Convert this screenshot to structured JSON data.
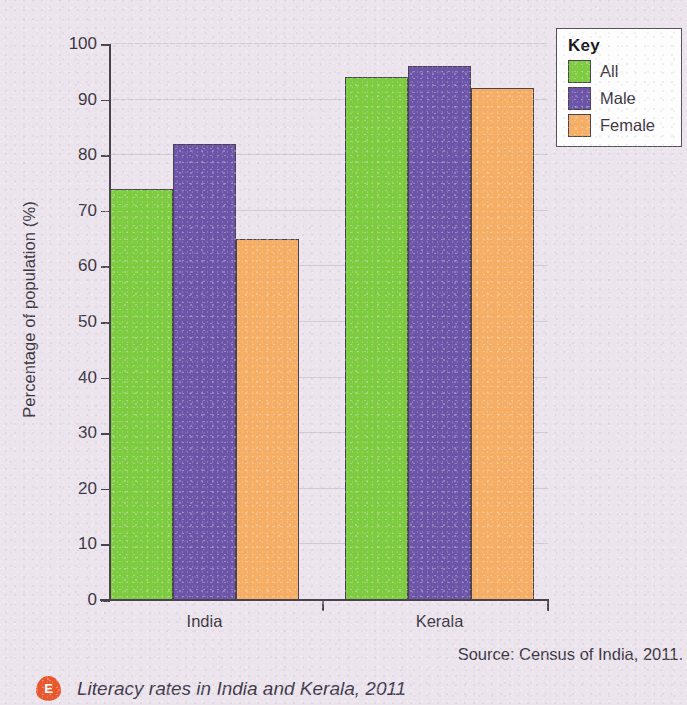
{
  "chart_data": {
    "type": "bar",
    "title": "Literacy rates in India and Kerala, 2011",
    "categories": [
      "India",
      "Kerala"
    ],
    "series": [
      {
        "name": "All",
        "values": [
          74,
          94
        ],
        "color": "#7DCB3F"
      },
      {
        "name": "Male",
        "values": [
          82,
          96
        ],
        "color": "#6C55A8"
      },
      {
        "name": "Female",
        "values": [
          65,
          92
        ],
        "color": "#F5AE63"
      }
    ],
    "xlabel": "",
    "ylabel": "Percentage of population (%)",
    "ylim": [
      0,
      100
    ],
    "ytick_step": 10,
    "yticks": [
      0,
      10,
      20,
      30,
      40,
      50,
      60,
      70,
      80,
      90,
      100
    ],
    "grid": true,
    "legend_position": "top-right",
    "legend_title": "Key",
    "source": "Source: Census of India, 2011."
  },
  "figure": {
    "badge_label": "E",
    "caption": "Literacy rates in India and Kerala, 2011",
    "background_color": "#ECE4ED",
    "axis_color": "#4A424F"
  }
}
